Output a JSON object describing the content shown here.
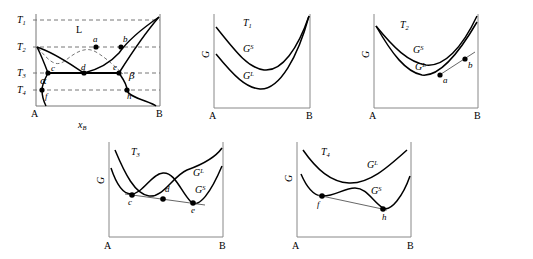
{
  "figure": {
    "type": "phase-diagram-with-free-energy-curves"
  },
  "phase_diagram": {
    "name": "T-x phase diagram",
    "temperature_labels": [
      "T",
      "T",
      "T",
      "T"
    ],
    "temperature_subs": [
      "1",
      "2",
      "3",
      "4"
    ],
    "temperature_y": [
      20,
      47,
      73,
      90
    ],
    "x_axis_label": "x",
    "x_axis_label_sub": "B",
    "left_endpoint": "A",
    "right_endpoint": "B",
    "region_labels": [
      "L",
      "α",
      "β"
    ],
    "points": [
      "a",
      "b",
      "c",
      "d",
      "e",
      "f",
      "h"
    ],
    "point_coords": {
      "a": [
        96,
        47
      ],
      "b": [
        121,
        47
      ],
      "c": [
        48,
        73
      ],
      "d": [
        84,
        73
      ],
      "e": [
        119,
        73
      ],
      "f": [
        42,
        90
      ],
      "h": [
        127,
        90
      ]
    },
    "liquidus_note": "liquidus descends from A-side T2 and from B-side T1 meeting at eutectic d",
    "solidus_note": "solidus c-d-e is the horizontal eutectic line at T3"
  },
  "panels": [
    {
      "id": "T1",
      "title": "T",
      "title_sub": "1",
      "y_axis_label": "G",
      "left_endpoint": "A",
      "right_endpoint": "B",
      "curves": [
        {
          "label": "G",
          "sup": "S",
          "position": "upper"
        },
        {
          "label": "G",
          "sup": "L",
          "position": "lower"
        }
      ],
      "points": [],
      "tangent": false,
      "note": "G-liquid lies below G-solid across whole range; curves converge at B"
    },
    {
      "id": "T2",
      "title": "T",
      "title_sub": "2",
      "y_axis_label": "G",
      "left_endpoint": "A",
      "right_endpoint": "B",
      "curves": [
        {
          "label": "G",
          "sup": "S",
          "position": "upper"
        },
        {
          "label": "G",
          "sup": "L",
          "position": "lower"
        }
      ],
      "points": [
        "a",
        "b"
      ],
      "tangent": true,
      "note": "common tangent touches G-liquid at a and G-solid at b near the B-rich side"
    },
    {
      "id": "T3",
      "title": "T",
      "title_sub": "3",
      "y_axis_label": "G",
      "left_endpoint": "A",
      "right_endpoint": "B",
      "curves": [
        {
          "label": "G",
          "sup": "L",
          "position": "middle-hump"
        },
        {
          "label": "G",
          "sup": "S",
          "position": "double-well"
        }
      ],
      "points": [
        "c",
        "d",
        "e"
      ],
      "tangent": true,
      "note": "triple common tangent touches solid at c, liquid at d, solid at e (eutectic condition)"
    },
    {
      "id": "T4",
      "title": "T",
      "title_sub": "4",
      "y_axis_label": "G",
      "left_endpoint": "A",
      "right_endpoint": "B",
      "curves": [
        {
          "label": "G",
          "sup": "L",
          "position": "upper"
        },
        {
          "label": "G",
          "sup": "S",
          "position": "lower-double-well"
        }
      ],
      "points": [
        "f",
        "h"
      ],
      "tangent": true,
      "note": "G-solid lies below G-liquid everywhere; common tangent on solid curve at f and h"
    }
  ],
  "colors": {
    "curve": "#000000",
    "axis": "#808080",
    "dashed": "#666666",
    "tangent": "#555555",
    "point": "#000000"
  }
}
